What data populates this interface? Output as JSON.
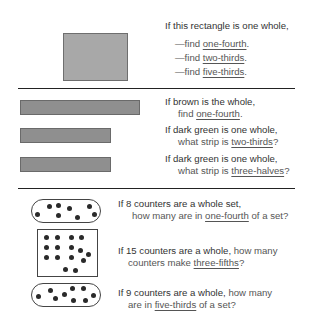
{
  "section1": {
    "line1": "If this rectangle is one whole,",
    "items": [
      {
        "prefix": "—find ",
        "term": "one-fourth",
        "suffix": "."
      },
      {
        "prefix": "—find ",
        "term": "two-thirds",
        "suffix": "."
      },
      {
        "prefix": "—find ",
        "term": "five-thirds",
        "suffix": "."
      }
    ]
  },
  "section2": {
    "q1": {
      "line1": "If brown is the whole,",
      "prefix": "find ",
      "term": "one-fourth",
      "suffix": "."
    },
    "q2": {
      "line1": "If dark green is one whole,",
      "prefix": "what strip is ",
      "term": "two-thirds",
      "suffix": "?"
    },
    "q3": {
      "line1": "If dark green is one whole,",
      "prefix": "what strip is ",
      "term": "three-halves",
      "suffix": "?"
    }
  },
  "section3": {
    "q1": {
      "line1": "If 8 counters are a whole set,",
      "prefix": "how many are in ",
      "term": "one-fourth",
      "suffix": " of a set?"
    },
    "q2": {
      "line1a": "If 15 counters are a whole,",
      "line1b": " how many",
      "prefix": "counters make ",
      "term": "three-fifths",
      "suffix": "?"
    },
    "q3": {
      "line1a": "If 9 counters are a whole,",
      "line1b": " how many",
      "prefix": "are in ",
      "term": "five-thirds",
      "suffix": " of a set?"
    }
  },
  "colors": {
    "rectangle": "#a8a8a8",
    "strip": "#8f8f8f",
    "counter": "#2a2a2a",
    "rule": "#222222"
  }
}
